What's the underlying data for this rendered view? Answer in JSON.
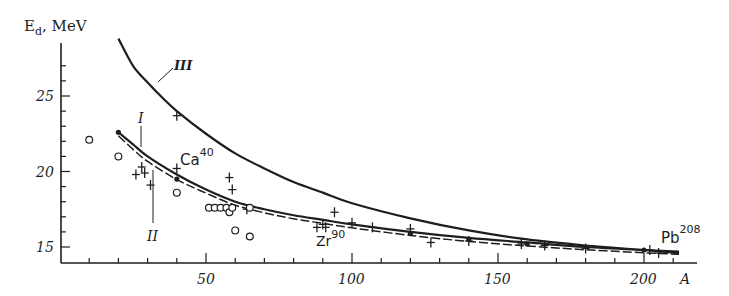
{
  "chart_data": {
    "type": "scatter",
    "title": "",
    "xlabel": "A",
    "ylabel": "E_d, MeV",
    "xlim": [
      0,
      215
    ],
    "ylim": [
      14,
      28
    ],
    "grid": false,
    "x_ticks": [
      50,
      100,
      150,
      200
    ],
    "y_ticks": [
      15,
      20,
      25
    ],
    "series": [
      {
        "name": "Curve III",
        "kind": "line",
        "style": "solid",
        "points": [
          [
            20,
            28.8
          ],
          [
            25,
            27.0
          ],
          [
            30,
            25.9
          ],
          [
            35,
            24.9
          ],
          [
            40,
            24.0
          ],
          [
            50,
            22.5
          ],
          [
            60,
            21.2
          ],
          [
            70,
            20.2
          ],
          [
            80,
            19.3
          ],
          [
            90,
            18.6
          ],
          [
            100,
            17.9
          ],
          [
            120,
            16.9
          ],
          [
            140,
            16.1
          ],
          [
            160,
            15.5
          ],
          [
            180,
            15.1
          ],
          [
            200,
            14.8
          ],
          [
            212,
            14.6
          ]
        ]
      },
      {
        "name": "Curve I",
        "kind": "line",
        "style": "solid",
        "points": [
          [
            20,
            22.6
          ],
          [
            25,
            21.8
          ],
          [
            30,
            21.0
          ],
          [
            40,
            19.8
          ],
          [
            50,
            18.8
          ],
          [
            60,
            18.0
          ],
          [
            70,
            17.5
          ],
          [
            80,
            17.1
          ],
          [
            90,
            16.8
          ],
          [
            100,
            16.5
          ],
          [
            120,
            16.0
          ],
          [
            140,
            15.6
          ],
          [
            160,
            15.3
          ],
          [
            180,
            15.0
          ],
          [
            200,
            14.8
          ],
          [
            212,
            14.7
          ]
        ]
      },
      {
        "name": "Curve II",
        "kind": "line",
        "style": "dashed",
        "points": [
          [
            20,
            22.5
          ],
          [
            25,
            21.6
          ],
          [
            30,
            20.8
          ],
          [
            40,
            19.6
          ],
          [
            50,
            18.7
          ],
          [
            60,
            17.9
          ],
          [
            70,
            17.4
          ],
          [
            80,
            17.0
          ],
          [
            90,
            16.7
          ],
          [
            100,
            16.4
          ],
          [
            120,
            15.9
          ],
          [
            140,
            15.5
          ],
          [
            160,
            15.2
          ],
          [
            180,
            14.95
          ],
          [
            200,
            14.75
          ],
          [
            212,
            14.65
          ]
        ]
      },
      {
        "name": "Experimental (+)",
        "kind": "marker",
        "marker": "plus",
        "points": [
          [
            26,
            19.8
          ],
          [
            28,
            20.3
          ],
          [
            29,
            19.9
          ],
          [
            31,
            19.1
          ],
          [
            40,
            23.7
          ],
          [
            40,
            20.2
          ],
          [
            58,
            19.6
          ],
          [
            59,
            18.8
          ],
          [
            64,
            17.5
          ],
          [
            88,
            16.3
          ],
          [
            90,
            16.5
          ],
          [
            91,
            16.3
          ],
          [
            94,
            17.3
          ],
          [
            100,
            16.6
          ],
          [
            107,
            16.3
          ],
          [
            120,
            16.2
          ],
          [
            127,
            15.3
          ],
          [
            140,
            15.4
          ],
          [
            158,
            15.2
          ],
          [
            166,
            15.1
          ],
          [
            180,
            14.9
          ],
          [
            202,
            14.8
          ],
          [
            205,
            14.6
          ]
        ]
      },
      {
        "name": "Experimental (o)",
        "kind": "marker",
        "marker": "circle",
        "points": [
          [
            10,
            22.1
          ],
          [
            20,
            21.0
          ],
          [
            40,
            18.6
          ],
          [
            51,
            17.6
          ],
          [
            53,
            17.6
          ],
          [
            55,
            17.6
          ],
          [
            57,
            17.6
          ],
          [
            58,
            17.3
          ],
          [
            59,
            17.6
          ],
          [
            65,
            17.6
          ],
          [
            60,
            16.1
          ],
          [
            65,
            15.7
          ]
        ]
      },
      {
        "name": "Calculated (•)",
        "kind": "marker",
        "marker": "dot",
        "points": [
          [
            20,
            22.6
          ],
          [
            40,
            19.5
          ],
          [
            120,
            15.9
          ],
          [
            140,
            15.5
          ],
          [
            160,
            15.2
          ],
          [
            200,
            14.8
          ]
        ]
      }
    ],
    "annotations": [
      {
        "text": "III",
        "x": 45,
        "y": 27.0,
        "note": "label for upper curve"
      },
      {
        "text": "I",
        "x": 30,
        "y": 22.0,
        "note": "label for solid lower curve"
      },
      {
        "text": "II",
        "x": 30,
        "y": 15.6,
        "note": "label for dashed lower curve"
      },
      {
        "text": "Ca",
        "sup": "40",
        "x": 42,
        "y": 20.4
      },
      {
        "text": "Zr",
        "sup": "90",
        "x": 86,
        "y": 15.4
      },
      {
        "text": "Pb",
        "sup": "208",
        "x": 201,
        "y": 15.3
      }
    ]
  },
  "labels": {
    "y_axis": "E",
    "y_axis_sub": "d",
    "y_axis_unit": ", MeV",
    "x_axis": "A",
    "tick_x_50": "50",
    "tick_x_100": "100",
    "tick_x_150": "150",
    "tick_x_200": "200",
    "tick_y_15": "15",
    "tick_y_20": "20",
    "tick_y_25": "25",
    "curve_I": "I",
    "curve_II": "II",
    "curve_III": "III",
    "ca": "Ca",
    "ca_sup": "40",
    "zr": "Zr",
    "zr_sup": "90",
    "pb": "Pb",
    "pb_sup": "208"
  }
}
